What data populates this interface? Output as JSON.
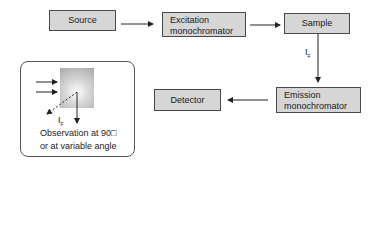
{
  "diagram": {
    "nodes": {
      "source": "Source",
      "excitation_line1": "Excitation",
      "excitation_line2": "monochromator",
      "sample": "Sample",
      "emission_line1": "Emission",
      "emission_line2": "monochromator",
      "detector": "Detector"
    },
    "edges": [
      {
        "from": "Source",
        "to": "Excitation monochromator"
      },
      {
        "from": "Excitation monochromator",
        "to": "Sample"
      },
      {
        "from": "Sample",
        "to": "Emission monochromator",
        "label": "I_F"
      },
      {
        "from": "Emission monochromator",
        "to": "Detector"
      }
    ],
    "fluorescence_label": {
      "main": "I",
      "sub": "F"
    },
    "inset": {
      "label": {
        "main": "I",
        "sub": "F"
      },
      "caption_line1": "Observation at 90□",
      "caption_line2": "or at variable angle"
    },
    "colors": {
      "box_fill": "#d6d6d6",
      "box_border": "#4a4a4a",
      "line": "#222222"
    }
  }
}
